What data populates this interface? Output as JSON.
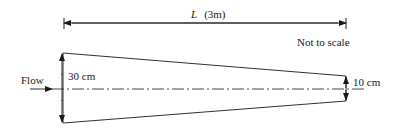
{
  "diagram": {
    "length_label": {
      "symbol": "L",
      "value": "(3m)"
    },
    "note": "Not to scale",
    "flow_label": "Flow",
    "inlet_diameter": "30 cm",
    "outlet_diameter": "10 cm"
  },
  "colors": {
    "line": "#1a1a1a",
    "background": "#ffffff"
  }
}
